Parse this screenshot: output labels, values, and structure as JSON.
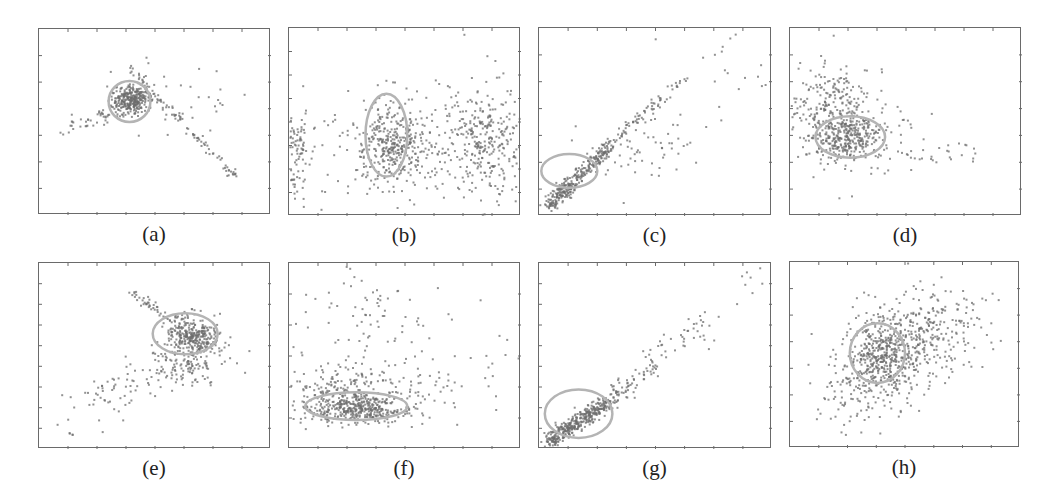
{
  "figure": {
    "background": "#ffffff",
    "point_color": "#6e6e6e",
    "ellipse_color": "#b4b4b4",
    "axis_color": "#6a6a6a"
  },
  "chart_data": [
    {
      "type": "scatter",
      "label": "(a)",
      "title": "",
      "xlabel": "",
      "ylabel": "",
      "grid": false,
      "box": {
        "left": 38,
        "top": 28,
        "width": 232,
        "height": 186
      },
      "ticks": {
        "x": 8,
        "y": 7
      },
      "ellipse": {
        "cx": 0.39,
        "cy": 0.39,
        "rx": 0.09,
        "ry": 0.11,
        "rot": 0
      },
      "clusters": [
        {
          "n": 320,
          "cx": 0.4,
          "cy": 0.38,
          "sx": 0.045,
          "sy": 0.035,
          "rot": -35
        },
        {
          "n": 90,
          "line": [
            0.38,
            0.2,
            0.85,
            0.8
          ],
          "spread": 0.012
        },
        {
          "n": 40,
          "line": [
            0.1,
            0.55,
            0.35,
            0.44
          ],
          "spread": 0.02
        },
        {
          "n": 40,
          "cx": 0.6,
          "cy": 0.4,
          "sx": 0.12,
          "sy": 0.13,
          "rot": 0
        }
      ]
    },
    {
      "type": "scatter",
      "label": "(b)",
      "title": "",
      "xlabel": "",
      "ylabel": "",
      "grid": false,
      "box": {
        "left": 288,
        "top": 27,
        "width": 232,
        "height": 188
      },
      "ticks": {
        "x": 8,
        "y": 8
      },
      "ellipse": {
        "cx": 0.42,
        "cy": 0.57,
        "rx": 0.09,
        "ry": 0.22,
        "rot": 0
      },
      "clusters": [
        {
          "n": 330,
          "cx": 0.45,
          "cy": 0.61,
          "sx": 0.07,
          "sy": 0.11,
          "rot": 0
        },
        {
          "n": 320,
          "cx": 0.83,
          "cy": 0.6,
          "sx": 0.09,
          "sy": 0.15,
          "rot": 0
        },
        {
          "n": 90,
          "cx": 0.03,
          "cy": 0.67,
          "sx": 0.03,
          "sy": 0.12,
          "rot": 0
        },
        {
          "n": 150,
          "cx": 0.4,
          "cy": 0.65,
          "sx": 0.28,
          "sy": 0.14,
          "rot": 0
        }
      ]
    },
    {
      "type": "scatter",
      "label": "(c)",
      "title": "",
      "xlabel": "",
      "ylabel": "",
      "grid": false,
      "box": {
        "left": 538,
        "top": 27,
        "width": 233,
        "height": 188
      },
      "ticks": {
        "x": 8,
        "y": 7
      },
      "ellipse": {
        "cx": 0.13,
        "cy": 0.76,
        "rx": 0.12,
        "ry": 0.09,
        "rot": 0
      },
      "clusters": [
        {
          "n": 320,
          "line": [
            0.04,
            0.95,
            0.3,
            0.63
          ],
          "spread": 0.018
        },
        {
          "n": 70,
          "line": [
            0.3,
            0.63,
            0.62,
            0.28
          ],
          "spread": 0.015
        },
        {
          "n": 60,
          "cx": 0.45,
          "cy": 0.65,
          "sx": 0.14,
          "sy": 0.1,
          "rot": -25
        },
        {
          "n": 20,
          "cx": 0.78,
          "cy": 0.22,
          "sx": 0.1,
          "sy": 0.12,
          "rot": 0
        }
      ]
    },
    {
      "type": "scatter",
      "label": "(d)",
      "title": "",
      "xlabel": "",
      "ylabel": "",
      "grid": false,
      "box": {
        "left": 789,
        "top": 27,
        "width": 232,
        "height": 188
      },
      "ticks": {
        "x": 8,
        "y": 7
      },
      "ellipse": {
        "cx": 0.26,
        "cy": 0.58,
        "rx": 0.15,
        "ry": 0.11,
        "rot": 0
      },
      "clusters": [
        {
          "n": 280,
          "cx": 0.24,
          "cy": 0.58,
          "sx": 0.07,
          "sy": 0.06,
          "rot": 0
        },
        {
          "n": 250,
          "cx": 0.18,
          "cy": 0.44,
          "sx": 0.09,
          "sy": 0.13,
          "rot": 0
        },
        {
          "n": 70,
          "cx": 0.32,
          "cy": 0.6,
          "sx": 0.12,
          "sy": 0.12,
          "rot": 0
        },
        {
          "n": 18,
          "cx": 0.6,
          "cy": 0.67,
          "sx": 0.08,
          "sy": 0.03,
          "rot": 0
        },
        {
          "n": 6,
          "cx": 0.76,
          "cy": 0.68,
          "sx": 0.02,
          "sy": 0.03,
          "rot": 0
        }
      ]
    },
    {
      "type": "scatter",
      "label": "(e)",
      "title": "",
      "xlabel": "",
      "ylabel": "",
      "grid": false,
      "box": {
        "left": 38,
        "top": 262,
        "width": 232,
        "height": 186
      },
      "ticks": {
        "x": 8,
        "y": 9
      },
      "ellipse": {
        "cx": 0.63,
        "cy": 0.38,
        "rx": 0.14,
        "ry": 0.11,
        "rot": 0
      },
      "clusters": [
        {
          "n": 320,
          "cx": 0.67,
          "cy": 0.39,
          "sx": 0.06,
          "sy": 0.05,
          "rot": 30
        },
        {
          "n": 130,
          "cx": 0.62,
          "cy": 0.56,
          "sx": 0.09,
          "sy": 0.05,
          "rot": 0
        },
        {
          "n": 45,
          "line": [
            0.39,
            0.14,
            0.58,
            0.32
          ],
          "spread": 0.015
        },
        {
          "n": 60,
          "cx": 0.3,
          "cy": 0.7,
          "sx": 0.11,
          "sy": 0.07,
          "rot": -15
        },
        {
          "n": 4,
          "line": [
            0.13,
            0.91,
            0.16,
            0.95
          ],
          "spread": 0.005
        }
      ]
    },
    {
      "type": "scatter",
      "label": "(f)",
      "title": "",
      "xlabel": "",
      "ylabel": "",
      "grid": false,
      "box": {
        "left": 288,
        "top": 262,
        "width": 232,
        "height": 186
      },
      "ticks": {
        "x": 8,
        "y": 6
      },
      "ellipse": {
        "cx": 0.29,
        "cy": 0.77,
        "rx": 0.22,
        "ry": 0.075,
        "rot": 0
      },
      "clusters": [
        {
          "n": 380,
          "cx": 0.3,
          "cy": 0.78,
          "sx": 0.11,
          "sy": 0.04,
          "rot": 0
        },
        {
          "n": 150,
          "cx": 0.25,
          "cy": 0.68,
          "sx": 0.11,
          "sy": 0.06,
          "rot": 0
        },
        {
          "n": 100,
          "cx": 0.3,
          "cy": 0.35,
          "sx": 0.18,
          "sy": 0.18,
          "rot": 0
        },
        {
          "n": 60,
          "cx": 0.55,
          "cy": 0.7,
          "sx": 0.12,
          "sy": 0.1,
          "rot": 0
        },
        {
          "n": 12,
          "cx": 0.9,
          "cy": 0.55,
          "sx": 0.05,
          "sy": 0.12,
          "rot": 0
        }
      ]
    },
    {
      "type": "scatter",
      "label": "(g)",
      "title": "",
      "xlabel": "",
      "ylabel": "",
      "grid": false,
      "box": {
        "left": 538,
        "top": 262,
        "width": 233,
        "height": 186
      },
      "ticks": {
        "x": 8,
        "y": 9
      },
      "ellipse": {
        "cx": 0.17,
        "cy": 0.81,
        "rx": 0.145,
        "ry": 0.13,
        "rot": 0
      },
      "clusters": [
        {
          "n": 380,
          "line": [
            0.04,
            0.96,
            0.3,
            0.74
          ],
          "spread": 0.02
        },
        {
          "n": 70,
          "line": [
            0.3,
            0.74,
            0.5,
            0.55
          ],
          "spread": 0.025
        },
        {
          "n": 40,
          "line": [
            0.48,
            0.52,
            0.75,
            0.3
          ],
          "spread": 0.04
        },
        {
          "n": 10,
          "line": [
            0.8,
            0.22,
            0.96,
            0.05
          ],
          "spread": 0.04
        }
      ]
    },
    {
      "type": "scatter",
      "label": "(h)",
      "title": "",
      "xlabel": "",
      "ylabel": "",
      "grid": false,
      "box": {
        "left": 789,
        "top": 261,
        "width": 230,
        "height": 186
      },
      "ticks": {
        "x": 8,
        "y": 7
      },
      "ellipse": {
        "cx": 0.38,
        "cy": 0.49,
        "rx": 0.12,
        "ry": 0.16,
        "rot": 0
      },
      "clusters": [
        {
          "n": 400,
          "cx": 0.4,
          "cy": 0.51,
          "sx": 0.08,
          "sy": 0.1,
          "rot": 0
        },
        {
          "n": 300,
          "cx": 0.55,
          "cy": 0.4,
          "sx": 0.12,
          "sy": 0.12,
          "rot": -25
        },
        {
          "n": 100,
          "cx": 0.3,
          "cy": 0.7,
          "sx": 0.1,
          "sy": 0.1,
          "rot": -30
        },
        {
          "n": 40,
          "cx": 0.75,
          "cy": 0.3,
          "sx": 0.12,
          "sy": 0.1,
          "rot": 0
        }
      ]
    }
  ]
}
